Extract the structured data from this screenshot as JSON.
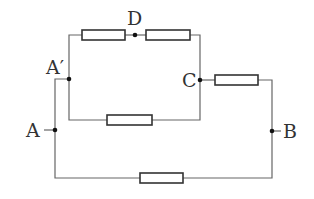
{
  "diagram": {
    "type": "circuit",
    "labels": {
      "A": "A",
      "A_prime": "A′",
      "B": "B",
      "C": "C",
      "D": "D"
    },
    "colors": {
      "wire": "#666666",
      "resistor": "#333333",
      "node": "#111111",
      "label": "#333333"
    },
    "resistors": [
      {
        "id": "R1",
        "between": [
          "A′",
          "D"
        ]
      },
      {
        "id": "R2",
        "between": [
          "D",
          "C"
        ]
      },
      {
        "id": "R3",
        "between": [
          "A′",
          "C"
        ]
      },
      {
        "id": "R4",
        "between": [
          "C",
          "B"
        ]
      },
      {
        "id": "R5",
        "between": [
          "A",
          "B"
        ]
      }
    ]
  }
}
